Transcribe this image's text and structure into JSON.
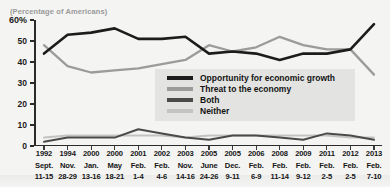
{
  "title_fragment": "",
  "subtitle": "(Percentage of Americans)",
  "axis": {
    "y_unit_suffix": "%",
    "y_ticks": [
      "60%",
      "50",
      "40",
      "30",
      "20",
      "10",
      "0"
    ]
  },
  "legend": {
    "items": [
      {
        "label": "Opportunity for economic growth",
        "color": "#1c1c1c",
        "name": "opportunity"
      },
      {
        "label": "Threat to the economy",
        "color": "#9b9b9b",
        "name": "threat"
      },
      {
        "label": "Both",
        "color": "#4a4a4a",
        "name": "both"
      },
      {
        "label": "Neither",
        "color": "#c3c3c3",
        "name": "neither"
      }
    ]
  },
  "chart_data": {
    "type": "line",
    "title": "",
    "subtitle": "(Percentage of Americans)",
    "xlabel": "",
    "ylabel": "",
    "ylim": [
      0,
      60
    ],
    "yticks": [
      0,
      10,
      20,
      30,
      40,
      50,
      60
    ],
    "grid": false,
    "legend_position": "center-right-inside",
    "categories": [
      "1992 Sept. 11-15",
      "1994 Nov. 28-29",
      "2000 Jan. 13-16",
      "2000 May 18-21",
      "2001 Feb. 1-4",
      "2002 Feb. 4-6",
      "2003 Nov. 14-16",
      "2005 June 24-26",
      "2005 Dec. 9-11",
      "2006 Feb. 6-9",
      "2008 Feb. 11-14",
      "2009 Feb. 9-12",
      "2011 Feb. 2-5",
      "2012 Feb. 2-5",
      "2013 Feb. 7-10"
    ],
    "x_tick_labels": [
      {
        "year": "1992",
        "month": "Sept.",
        "days": "11-15"
      },
      {
        "year": "1994",
        "month": "Nov.",
        "days": "28-29"
      },
      {
        "year": "2000",
        "month": "Jan.",
        "days": "13-16"
      },
      {
        "year": "2000",
        "month": "May",
        "days": "18-21"
      },
      {
        "year": "2001",
        "month": "Feb.",
        "days": "1-4"
      },
      {
        "year": "2002",
        "month": "Feb.",
        "days": "4-6"
      },
      {
        "year": "2003",
        "month": "Nov.",
        "days": "14-16"
      },
      {
        "year": "2005",
        "month": "June",
        "days": "24-26"
      },
      {
        "year": "2005",
        "month": "Dec.",
        "days": "9-11"
      },
      {
        "year": "2006",
        "month": "Feb.",
        "days": "6-9"
      },
      {
        "year": "2008",
        "month": "Feb.",
        "days": "11-14"
      },
      {
        "year": "2009",
        "month": "Feb.",
        "days": "9-12"
      },
      {
        "year": "2011",
        "month": "Feb.",
        "days": "2-5"
      },
      {
        "year": "2012",
        "month": "Feb.",
        "days": "2-5"
      },
      {
        "year": "2013",
        "month": "Feb.",
        "days": "7-10"
      }
    ],
    "series": [
      {
        "name": "Opportunity for economic growth",
        "color": "#1c1c1c",
        "values": [
          44,
          53,
          54,
          56,
          51,
          51,
          52,
          44,
          45,
          44,
          41,
          44,
          44,
          46,
          58
        ]
      },
      {
        "name": "Threat to the economy",
        "color": "#9b9b9b",
        "values": [
          48,
          38,
          35,
          36,
          37,
          39,
          41,
          48,
          45,
          47,
          52,
          48,
          46,
          46,
          34
        ]
      },
      {
        "name": "Both",
        "color": "#4a4a4a",
        "values": [
          2,
          4,
          4,
          4,
          8,
          6,
          4,
          3,
          5,
          5,
          4,
          3,
          6,
          5,
          3
        ]
      },
      {
        "name": "Neither",
        "color": "#c3c3c3",
        "values": [
          4,
          5,
          5,
          5,
          5,
          5,
          4,
          5,
          5,
          5,
          5,
          5,
          5,
          4,
          4
        ]
      }
    ]
  }
}
